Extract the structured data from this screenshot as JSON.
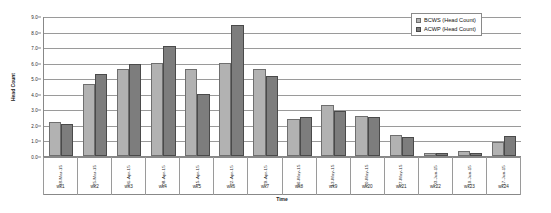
{
  "chart_data": {
    "type": "bar",
    "title": "",
    "xlabel": "Time",
    "ylabel": "Head Count",
    "ylim": [
      0.0,
      9.0
    ],
    "ytick_labels": [
      "9.0",
      "8.0",
      "7.0",
      "6.0",
      "5.0",
      "4.0",
      "3.0",
      "2.0",
      "1.0",
      "0.0"
    ],
    "ytick_values": [
      9.0,
      8.0,
      7.0,
      6.0,
      5.0,
      4.0,
      3.0,
      2.0,
      1.0,
      0.0
    ],
    "grid": true,
    "legend_position": "top-right",
    "categories": [
      "wk1",
      "wk2",
      "wk3",
      "wk4",
      "wk5",
      "wk6",
      "wk7",
      "wk8",
      "wk9",
      "wk10",
      "wk11",
      "wk12",
      "wk13",
      "wk14"
    ],
    "category_labels": [
      "wk1",
      "wk2",
      "wk3",
      "wk4",
      "wk5",
      "wk6",
      "wk8",
      "wk9",
      "wk10",
      "wk20",
      "wk21",
      "wk22",
      "wk23",
      "wk24"
    ],
    "x": [
      "18-Mar-15",
      "25-Mar-15",
      "01-Apr-15",
      "08-Apr-15",
      "15-Apr-15",
      "22-Apr-15",
      "29-Apr-15",
      "06-May-15",
      "13-May-15",
      "20-May-15",
      "27-May-15",
      "03-Jun-15",
      "10-Jun-15",
      "17-Jun-15"
    ],
    "week_labels": [
      "wk1",
      "wk2",
      "wk3",
      "wk4",
      "wk5",
      "wk6",
      "wk7",
      "wk8",
      "wk9",
      "wk20",
      "wk21",
      "wk22",
      "wk23",
      "wk24"
    ],
    "series": [
      {
        "name": "BCWS (Head Count)",
        "color": "#b2b2b2",
        "values": [
          2.2,
          4.6,
          5.6,
          6.0,
          5.6,
          6.0,
          5.6,
          2.4,
          3.25,
          2.55,
          1.35,
          0.2,
          0.35,
          0.9
        ]
      },
      {
        "name": "ACWP (Head Count)",
        "color": "#7d7d7d",
        "values": [
          2.05,
          5.3,
          5.9,
          7.1,
          4.0,
          8.4,
          5.15,
          2.5,
          2.9,
          2.5,
          1.2,
          0.2,
          0.2,
          1.3
        ]
      }
    ]
  },
  "legend": {
    "items": [
      {
        "label": "BCWS (Head Count)",
        "color": "#b2b2b2"
      },
      {
        "label": "ACWP (Head Count)",
        "color": "#7d7d7d"
      }
    ]
  },
  "axes": {
    "y_title": "Head Count",
    "x_title": "Time"
  }
}
